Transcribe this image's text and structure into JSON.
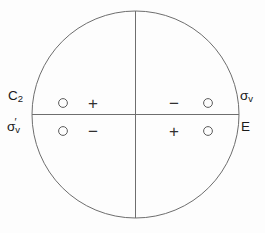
{
  "diagram": {
    "kind": "stereographic-projection",
    "title": "",
    "background_color": "#fdfdfd",
    "stroke_color": "#6e6e6e",
    "text_color": "#1a1a1a",
    "circle": {
      "center_x": 135.5,
      "center_y": 114.5,
      "radius": 103.5
    },
    "axes": {
      "vertical_line": true,
      "horizontal_line": true
    },
    "operation_labels": {
      "left_top": {
        "base": "C",
        "sub": "2",
        "prime": "",
        "full": "C2"
      },
      "left_bottom": {
        "base": "σ",
        "sub": "v",
        "prime": "′",
        "full": "σ′v"
      },
      "right_top": {
        "base": "σ",
        "sub": "v",
        "prime": "",
        "full": "σv"
      },
      "right_bottom": {
        "base": "E",
        "sub": "",
        "prime": "",
        "full": "E"
      }
    },
    "quadrants": [
      {
        "name": "upper-left",
        "marks": [
          {
            "symbol": "○",
            "kind": "open-circle",
            "x": 63,
            "y": 103
          },
          {
            "symbol": "+",
            "kind": "plus",
            "x": 95,
            "y": 103
          }
        ]
      },
      {
        "name": "upper-right",
        "marks": [
          {
            "symbol": "−",
            "kind": "minus",
            "x": 176,
            "y": 103
          },
          {
            "symbol": "○",
            "kind": "open-circle",
            "x": 208,
            "y": 103
          }
        ]
      },
      {
        "name": "lower-left",
        "marks": [
          {
            "symbol": "○",
            "kind": "open-circle",
            "x": 63,
            "y": 131
          },
          {
            "symbol": "−",
            "kind": "minus",
            "x": 95,
            "y": 131
          }
        ]
      },
      {
        "name": "lower-right",
        "marks": [
          {
            "symbol": "+",
            "kind": "plus",
            "x": 176,
            "y": 131
          },
          {
            "symbol": "○",
            "kind": "open-circle",
            "x": 208,
            "y": 131
          }
        ]
      }
    ]
  }
}
